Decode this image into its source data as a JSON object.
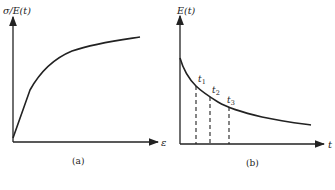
{
  "panels": [
    {
      "id": "a",
      "caption": "(a)",
      "y_label": "σ/E(t)",
      "x_label": "ε",
      "curve_description": "increasing concave curve from origin, rising steeply then leveling off"
    },
    {
      "id": "b",
      "caption": "(b)",
      "y_label": "E(t)",
      "x_label": "t",
      "curve_description": "decreasing convex relaxation curve",
      "markers": [
        "t1",
        "t2",
        "t3"
      ],
      "marker_labels": {
        "t1": "t",
        "t1_sub": "1",
        "t2": "t",
        "t2_sub": "2",
        "t3": "t",
        "t3_sub": "3"
      }
    }
  ],
  "colors": {
    "line": "#222222",
    "background": "#ffffff"
  }
}
